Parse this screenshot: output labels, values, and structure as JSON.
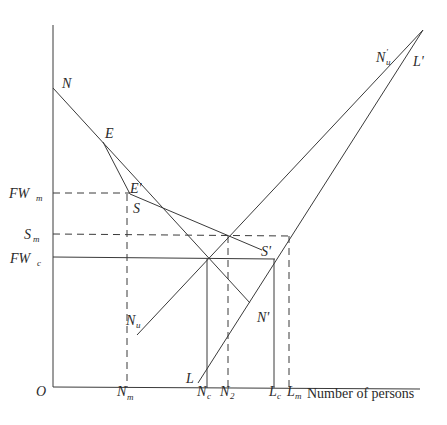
{
  "diagram": {
    "axes": {
      "origin_label": "O",
      "x_title": "Number of persons"
    },
    "y_labels": {
      "fw_m": {
        "main": "FW",
        "sub": "m"
      },
      "s_m": {
        "main": "S",
        "sub": "m"
      },
      "fw_c": {
        "main": "FW",
        "sub": "c"
      }
    },
    "x_labels": {
      "n_m": {
        "main": "N",
        "sub": "m"
      },
      "n_c": {
        "main": "N",
        "sub": "c"
      },
      "n_2": {
        "main": "N",
        "sub": "2"
      },
      "l_c": {
        "main": "L",
        "sub": "c"
      },
      "l_m": {
        "main": "L",
        "sub": "m"
      }
    },
    "curve_labels": {
      "n": "N",
      "e": "E",
      "e_prime": "E'",
      "s": "S",
      "s_prime": "S'",
      "n_prime": "N'",
      "n_u": {
        "main": "N",
        "sub": "u"
      },
      "n_u_prime": {
        "main": "N",
        "sub": "u",
        "prime": "'"
      },
      "l": "L",
      "l_prime": "L'"
    },
    "colors": {
      "line": "#3a3a3a",
      "text": "#2a2a2a",
      "background": "#ffffff"
    }
  }
}
